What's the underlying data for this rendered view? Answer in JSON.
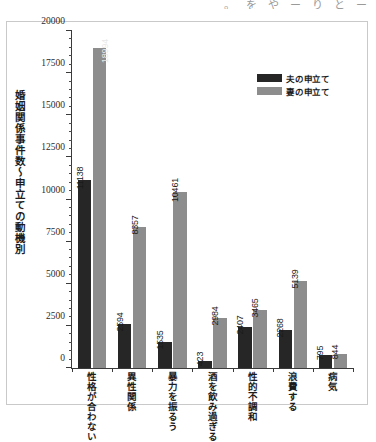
{
  "page": {
    "top_fragment_chars": [
      "。",
      "を",
      "や",
      "ー",
      "り",
      "と",
      "ー"
    ]
  },
  "chart_data": {
    "type": "bar",
    "title": "",
    "subtitle": "",
    "xlabel": "",
    "ylabel": "婚姻関係事件数〜申立ての動機別",
    "ylim": [
      0,
      20000
    ],
    "ytick_step": 2500,
    "yminor_step": 500,
    "grid": false,
    "legend_position": "top-right",
    "categories": [
      "性格が合わない",
      "異性関係",
      "暴力を振るう",
      "酒を飲み過ぎる",
      "性的不調和",
      "浪費する",
      "病気"
    ],
    "ytick_labels": [
      "0",
      "2500",
      "5000",
      "7500",
      "10000",
      "12500",
      "15000",
      "17500",
      "20000"
    ],
    "ytick_values": [
      0,
      2500,
      5000,
      7500,
      10000,
      12500,
      15000,
      17500,
      20000
    ],
    "series": [
      {
        "name": "夫の申立て",
        "color": "#262626",
        "values": [
          11138,
          2594,
          1535,
          423,
          2407,
          2268,
          795
        ]
      },
      {
        "name": "妻の申立て",
        "color": "#8d8d8d",
        "values": [
          18994,
          8357,
          10461,
          2984,
          3465,
          5139,
          844
        ]
      }
    ]
  }
}
